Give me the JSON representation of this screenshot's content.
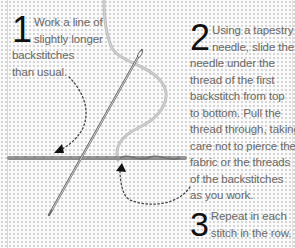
{
  "steps": [
    {
      "number": "1",
      "lines": [
        "Work a line of",
        "slightly longer",
        "backstitches",
        "than usual."
      ]
    },
    {
      "number": "2",
      "lines": [
        "Using a tapestry",
        "needle, slide the",
        "needle under the",
        "thread of the first",
        "backstitch from top",
        "to bottom. Pull the",
        "thread through, taking",
        "care not to pierce the",
        "fabric or the threads",
        "of the backstitches",
        "as you work."
      ]
    },
    {
      "number": "3",
      "lines": [
        "Repeat in each",
        "stitch in the row."
      ]
    }
  ],
  "colors": {
    "background": "#fafafa",
    "number": "#111111",
    "text": "#6a6a6a",
    "thread": "#8a8a8a",
    "needle": "#555555"
  }
}
